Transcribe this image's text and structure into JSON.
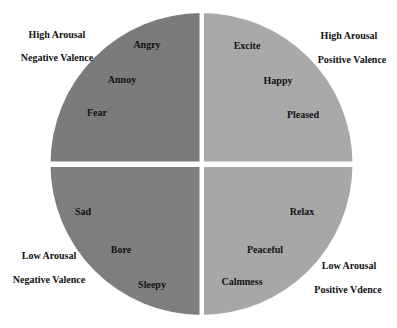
{
  "diagram": {
    "type": "quadrant-circle",
    "title": "",
    "colors": {
      "background": "#ffffff",
      "top_left": "#7b7b7b",
      "top_right": "#a9a9a9",
      "bottom_left": "#7e7e7e",
      "bottom_right": "#a7a7a7",
      "gap": "#ffffff",
      "text": "#111111"
    },
    "quadrants": {
      "top_left": {
        "arousal": "High Arousal",
        "valence": "Negative Valence",
        "emotions": [
          "Angry",
          "Annoy",
          "Fear"
        ]
      },
      "top_right": {
        "arousal": "High Arousal",
        "valence": "Positive Valence",
        "emotions": [
          "Excite",
          "Happy",
          "Pleased"
        ]
      },
      "bottom_left": {
        "arousal": "Low Arousal",
        "valence": "Negative Valence",
        "emotions": [
          "Sad",
          "Bore",
          "Sleepy"
        ]
      },
      "bottom_right": {
        "arousal": "Low Arousal",
        "valence": "Positive Vdence",
        "emotions": [
          "Relax",
          "Peaceful",
          "Calmness"
        ]
      }
    }
  }
}
